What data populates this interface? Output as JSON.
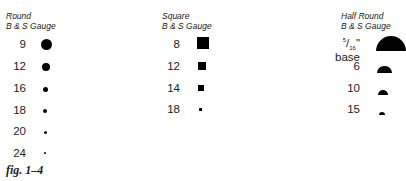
{
  "round": {
    "title_line1": "Round",
    "title_line2": "B & S Gauge",
    "items": [
      {
        "label": "9",
        "size": 11
      },
      {
        "label": "12",
        "size": 8
      },
      {
        "label": "16",
        "size": 5
      },
      {
        "label": "18",
        "size": 4
      },
      {
        "label": "20",
        "size": 3
      },
      {
        "label": "24",
        "size": 2
      }
    ]
  },
  "square": {
    "title_line1": "Square",
    "title_line2": "B & S Gauge",
    "items": [
      {
        "label": "8",
        "size": 12
      },
      {
        "label": "12",
        "size": 7
      },
      {
        "label": "14",
        "size": 5
      },
      {
        "label": "18",
        "size": 3
      }
    ]
  },
  "half_round": {
    "title_line1": "Half Round",
    "title_line2": "B & S Gauge",
    "items": [
      {
        "label_num": "5",
        "label_den": "16",
        "label_suffix": "\" base",
        "size": 30
      },
      {
        "label": "6",
        "size": 15
      },
      {
        "label": "10",
        "size": 10
      },
      {
        "label": "15",
        "size": 6
      }
    ]
  },
  "caption": "fig. 1–4"
}
